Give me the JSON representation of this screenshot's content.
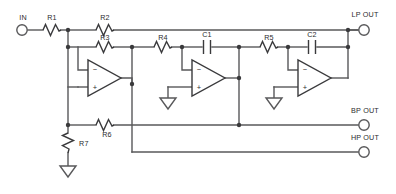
{
  "diagram": {
    "colors": {
      "wire": "#58585a",
      "component": "#3a3a3c",
      "background": "#ffffff",
      "label_text": "#2b2b2d"
    },
    "terminals": [
      {
        "id": "in",
        "label": "IN",
        "x": 22,
        "y": 30,
        "label_x": 22,
        "label_y": 19
      },
      {
        "id": "lp_out",
        "label": "LP OUT",
        "x": 364,
        "y": 29,
        "label_x": 364,
        "label_y": 16
      },
      {
        "id": "bp_out",
        "label": "BP OUT",
        "x": 364,
        "y": 125,
        "label_x": 364,
        "label_y": 113
      },
      {
        "id": "hp_out",
        "label": "HP OUT",
        "x": 364,
        "y": 152,
        "label_x": 364,
        "label_y": 140
      }
    ],
    "resistors": [
      {
        "id": "R1",
        "label": "R1",
        "orientation": "horizontal",
        "x": 52,
        "y": 30,
        "label_x": 52,
        "label_y": 19
      },
      {
        "id": "R2",
        "label": "R2",
        "orientation": "horizontal",
        "x": 105,
        "y": 30,
        "label_x": 105,
        "label_y": 19
      },
      {
        "id": "R3",
        "label": "R3",
        "orientation": "horizontal",
        "x": 105,
        "y": 47,
        "label_x": 105,
        "label_y": 39
      },
      {
        "id": "R4",
        "label": "R4",
        "orientation": "horizontal",
        "x": 163,
        "y": 47,
        "label_x": 163,
        "label_y": 39
      },
      {
        "id": "R5",
        "label": "R5",
        "orientation": "horizontal",
        "x": 269,
        "y": 47,
        "label_x": 269,
        "label_y": 39
      },
      {
        "id": "R6",
        "label": "R6",
        "orientation": "horizontal",
        "x": 105,
        "y": 125,
        "label_x": 107,
        "label_y": 136
      },
      {
        "id": "R7",
        "label": "R7",
        "orientation": "vertical",
        "x": 68,
        "y": 143,
        "label_x": 80,
        "label_y": 146
      }
    ],
    "capacitors": [
      {
        "id": "C1",
        "label": "C1",
        "orientation": "horizontal",
        "x": 207,
        "y": 47,
        "label_x": 207,
        "label_y": 36
      },
      {
        "id": "C2",
        "label": "C2",
        "orientation": "horizontal",
        "x": 312,
        "y": 47,
        "label_x": 312,
        "label_y": 36
      }
    ],
    "opamps": [
      {
        "id": "U1",
        "stage": "summing-amplifier",
        "x": 88,
        "y": 78,
        "inv_sign": "−",
        "noninv_sign": "+"
      },
      {
        "id": "U2",
        "stage": "first-integrator",
        "x": 182,
        "y": 78,
        "inv_sign": "−",
        "noninv_sign": "+"
      },
      {
        "id": "U3",
        "stage": "second-integrator",
        "x": 288,
        "y": 78,
        "inv_sign": "−",
        "noninv_sign": "+"
      }
    ],
    "grounds": [
      {
        "id": "GND1",
        "at": "R7-bottom",
        "x": 68,
        "y": 168
      },
      {
        "id": "GND2",
        "at": "U2-noninv",
        "x": 168,
        "y": 104
      },
      {
        "id": "GND3",
        "at": "U3-noninv",
        "x": 274,
        "y": 104
      }
    ],
    "junction_count": 14
  }
}
